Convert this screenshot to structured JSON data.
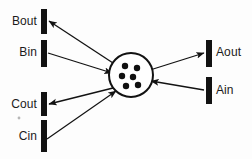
{
  "figure": {
    "type": "schematic-diagram",
    "background_color": "#fdfdfd",
    "stroke_color": "#121212",
    "canvas": {
      "width": 252,
      "height": 159
    }
  },
  "center": {
    "name": "central-compartment",
    "shape": "circle",
    "cx": 131,
    "cy": 75,
    "r": 22,
    "fill": "#ffffff",
    "stroke": "#121212",
    "stroke_width": 2,
    "dot_color": "#101010",
    "dot_count": 6,
    "dots": [
      {
        "cx": 125,
        "cy": 66,
        "r": 3.2
      },
      {
        "cx": 137,
        "cy": 68,
        "r": 3.2
      },
      {
        "cx": 122,
        "cy": 76,
        "r": 3.2
      },
      {
        "cx": 133,
        "cy": 77,
        "r": 3.2
      },
      {
        "cx": 126,
        "cy": 86,
        "r": 3.2
      },
      {
        "cx": 138,
        "cy": 85,
        "r": 3.2
      }
    ]
  },
  "ports": [
    {
      "id": "bout",
      "label": "Bout",
      "side": "left",
      "direction": "out",
      "bar": {
        "x": 41,
        "y": 9,
        "w": 6,
        "h": 25
      },
      "label_pos": {
        "x": 2,
        "y": 15,
        "w": 35
      },
      "arrow": {
        "x1": 113,
        "y1": 63,
        "x2": 49,
        "y2": 21
      }
    },
    {
      "id": "bin",
      "label": "Bin",
      "side": "left",
      "direction": "in",
      "bar": {
        "x": 41,
        "y": 40,
        "w": 6,
        "h": 27
      },
      "label_pos": {
        "x": 2,
        "y": 46,
        "w": 35
      },
      "arrow": {
        "x1": 48,
        "y1": 53,
        "x2": 112,
        "y2": 73
      }
    },
    {
      "id": "cout",
      "label": "Cout",
      "side": "left",
      "direction": "out",
      "bar": {
        "x": 41,
        "y": 92,
        "w": 6,
        "h": 24
      },
      "label_pos": {
        "x": 2,
        "y": 98,
        "w": 35
      },
      "arrow": {
        "x1": 113,
        "y1": 88,
        "x2": 49,
        "y2": 104
      }
    },
    {
      "id": "cin",
      "label": "Cin",
      "side": "left",
      "direction": "in",
      "bar": {
        "x": 41,
        "y": 120,
        "w": 6,
        "h": 32
      },
      "label_pos": {
        "x": 2,
        "y": 130,
        "w": 35
      },
      "arrow": {
        "x1": 47,
        "y1": 139,
        "x2": 116,
        "y2": 91
      }
    },
    {
      "id": "aout",
      "label": "Aout",
      "side": "right",
      "direction": "out",
      "bar": {
        "x": 206,
        "y": 40,
        "w": 6,
        "h": 27
      },
      "label_pos": {
        "x": 216,
        "y": 46
      },
      "arrow": {
        "x1": 150,
        "y1": 70,
        "x2": 204,
        "y2": 53
      }
    },
    {
      "id": "ain",
      "label": "Ain",
      "side": "right",
      "direction": "in",
      "bar": {
        "x": 206,
        "y": 77,
        "w": 6,
        "h": 27
      },
      "label_pos": {
        "x": 216,
        "y": 84
      },
      "arrow": {
        "x1": 204,
        "y1": 90,
        "x2": 151,
        "y2": 81
      }
    }
  ],
  "artifact": {
    "name": "stray-speck",
    "cx": 19,
    "cy": 118,
    "r": 1.4,
    "color": "#b7b7b7"
  }
}
